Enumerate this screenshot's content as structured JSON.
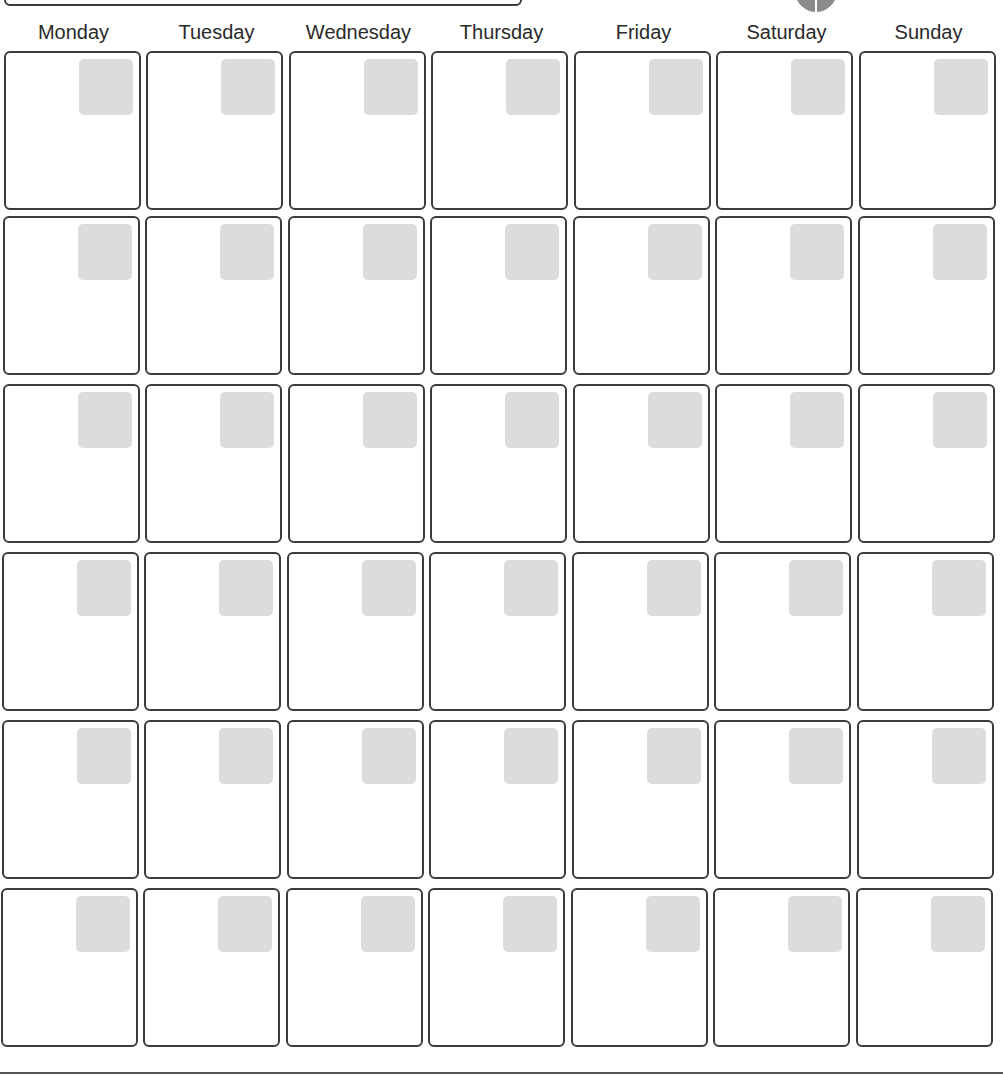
{
  "page": {
    "type": "blank monthly calendar template",
    "colors": {
      "border": "#3c3c3c",
      "badge": "#dcdcdc",
      "text": "#2a2a2a",
      "logo": "#8c8c8c"
    }
  },
  "header": {
    "title": "",
    "days": [
      {
        "label": "Monday"
      },
      {
        "label": "Tuesday"
      },
      {
        "label": "Wednesday"
      },
      {
        "label": "Thursday"
      },
      {
        "label": "Friday"
      },
      {
        "label": "Saturday"
      },
      {
        "label": "Sunday"
      }
    ]
  },
  "grid": {
    "rows": 6,
    "columns": 7,
    "cells": [
      [
        "",
        "",
        "",
        "",
        "",
        "",
        ""
      ],
      [
        "",
        "",
        "",
        "",
        "",
        "",
        ""
      ],
      [
        "",
        "",
        "",
        "",
        "",
        "",
        ""
      ],
      [
        "",
        "",
        "",
        "",
        "",
        "",
        ""
      ],
      [
        "",
        "",
        "",
        "",
        "",
        "",
        ""
      ],
      [
        "",
        "",
        "",
        "",
        "",
        "",
        ""
      ]
    ]
  }
}
